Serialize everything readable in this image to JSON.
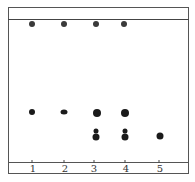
{
  "diagram": {
    "type": "thin-layer chromatography plate",
    "lanes": [
      {
        "label": "1",
        "x": 32,
        "spots": [
          {
            "y": 24,
            "d": 6
          },
          {
            "y": 112,
            "d": 6
          }
        ]
      },
      {
        "label": "2",
        "x": 64,
        "spots": [
          {
            "y": 24,
            "d": 6
          },
          {
            "y": 112,
            "d": 6
          }
        ]
      },
      {
        "label": "3",
        "x": 96,
        "spots": [
          {
            "y": 24,
            "d": 6
          },
          {
            "y": 113,
            "d": 8
          },
          {
            "y": 131,
            "d": 5
          },
          {
            "y": 137,
            "d": 7
          }
        ]
      },
      {
        "label": "4",
        "x": 125,
        "spots": [
          {
            "y": 24,
            "d": 6
          },
          {
            "y": 113,
            "d": 8
          },
          {
            "y": 131,
            "d": 5
          },
          {
            "y": 137,
            "d": 7
          }
        ]
      },
      {
        "label": "5",
        "x": 160,
        "spots": [
          {
            "y": 136,
            "d": 7
          }
        ]
      }
    ],
    "colors": {
      "spot": "#1a1a1a",
      "border": "#555555",
      "background": "#ffffff"
    }
  }
}
